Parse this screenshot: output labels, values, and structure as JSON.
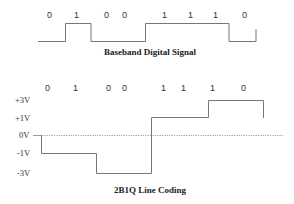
{
  "baseband": {
    "title": "Baseband Digital Signal",
    "bits": [
      "0",
      "1",
      "0",
      "0",
      "1",
      "1",
      "1",
      "0"
    ]
  },
  "coding_2b1q": {
    "title": "2B1Q Line Coding",
    "bits": [
      "0",
      "1",
      "0",
      "0",
      "1",
      "1",
      "1",
      "0"
    ],
    "levels": [
      "+3V",
      "+1V",
      "0V",
      "-1V",
      "-3V"
    ],
    "symbol_levels": [
      "-1V",
      "-3V",
      "+1V",
      "+3V"
    ]
  },
  "colors": {
    "waveform": "#777777",
    "text": "#333333",
    "background": "#ffffff"
  }
}
